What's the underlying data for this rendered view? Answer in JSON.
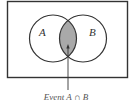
{
  "diagram": {
    "type": "venn",
    "sets": [
      {
        "label": "A"
      },
      {
        "label": "B"
      }
    ],
    "shaded_region": "intersection",
    "caption": "Event A ∩ B"
  },
  "colors": {
    "stroke": "#333333",
    "shade": "#a9a9a9",
    "background": "#ffffff"
  }
}
